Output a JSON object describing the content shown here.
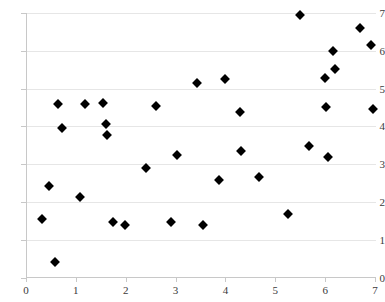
{
  "chart_data": {
    "type": "scatter",
    "title": "",
    "subtitle": "",
    "xlabel": "",
    "ylabel": "",
    "xlim": [
      0,
      7
    ],
    "ylim": [
      0,
      7
    ],
    "xticks": [
      0,
      1,
      2,
      3,
      4,
      5,
      6,
      7
    ],
    "yticks": [
      0,
      1,
      2,
      3,
      4,
      5,
      6,
      7
    ],
    "grid": "horizontal",
    "legend": null,
    "marker": "diamond",
    "marker_color": "#000000",
    "points": [
      {
        "x": 0.32,
        "y": 1.55
      },
      {
        "x": 0.46,
        "y": 2.42
      },
      {
        "x": 0.58,
        "y": 0.42
      },
      {
        "x": 0.64,
        "y": 4.58
      },
      {
        "x": 0.72,
        "y": 3.95
      },
      {
        "x": 1.08,
        "y": 2.12
      },
      {
        "x": 1.18,
        "y": 4.6
      },
      {
        "x": 1.55,
        "y": 4.62
      },
      {
        "x": 1.6,
        "y": 4.05
      },
      {
        "x": 1.62,
        "y": 3.78
      },
      {
        "x": 1.75,
        "y": 1.46
      },
      {
        "x": 1.99,
        "y": 1.4
      },
      {
        "x": 2.4,
        "y": 2.9
      },
      {
        "x": 2.6,
        "y": 4.55
      },
      {
        "x": 2.9,
        "y": 1.48
      },
      {
        "x": 3.02,
        "y": 3.25
      },
      {
        "x": 3.42,
        "y": 5.15
      },
      {
        "x": 3.55,
        "y": 1.38
      },
      {
        "x": 3.88,
        "y": 2.58
      },
      {
        "x": 4.0,
        "y": 5.25
      },
      {
        "x": 4.3,
        "y": 4.38
      },
      {
        "x": 4.32,
        "y": 3.35
      },
      {
        "x": 4.68,
        "y": 2.65
      },
      {
        "x": 5.26,
        "y": 1.68
      },
      {
        "x": 5.5,
        "y": 6.95
      },
      {
        "x": 5.68,
        "y": 3.48
      },
      {
        "x": 6.0,
        "y": 5.28
      },
      {
        "x": 6.02,
        "y": 4.5
      },
      {
        "x": 6.06,
        "y": 3.2
      },
      {
        "x": 6.16,
        "y": 6.0
      },
      {
        "x": 6.2,
        "y": 5.52
      },
      {
        "x": 6.7,
        "y": 6.6
      },
      {
        "x": 6.92,
        "y": 6.15
      },
      {
        "x": 6.96,
        "y": 4.45
      }
    ]
  }
}
